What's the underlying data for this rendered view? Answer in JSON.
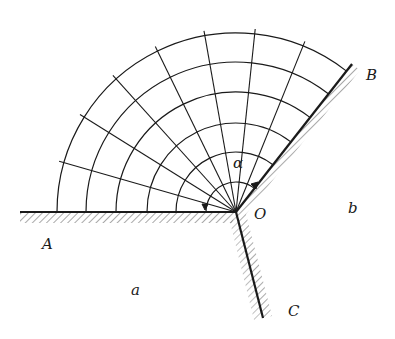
{
  "figure": {
    "labels": {
      "A": "A",
      "B": "B",
      "C": "C",
      "O": "O",
      "a": "a",
      "b": "b",
      "alpha": "α"
    },
    "colors": {
      "ink": "#1a1a1a",
      "background": "#ffffff"
    },
    "geometry": {
      "origin": [
        236,
        212
      ],
      "arc_radii": [
        179,
        150,
        120,
        89,
        60,
        30
      ],
      "ray_angles_deg": [
        164,
        148,
        132,
        116,
        100,
        84,
        68
      ],
      "wall_B_angle_deg": 52,
      "wall_A_angle_deg": 180,
      "wall_C_end": [
        263,
        318
      ]
    }
  }
}
